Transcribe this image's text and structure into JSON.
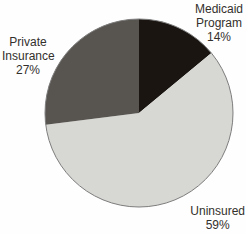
{
  "chart_data": {
    "type": "pie",
    "title": "",
    "categories": [
      "Medicaid Program",
      "Uninsured",
      "Private Insurance"
    ],
    "values": [
      14,
      59,
      27
    ],
    "value_unit": "%",
    "colors": [
      "#1a1511",
      "#d7d8d3",
      "#585450"
    ],
    "outline_color": "#7d7d7d",
    "start_angle_deg": 0,
    "direction": "clockwise",
    "legend": "none",
    "background": "#fefefe",
    "labels": [
      "Medicaid\nProgram\n14%",
      "Uninsured\n59%",
      "Private\nInsurance\n27%"
    ]
  }
}
